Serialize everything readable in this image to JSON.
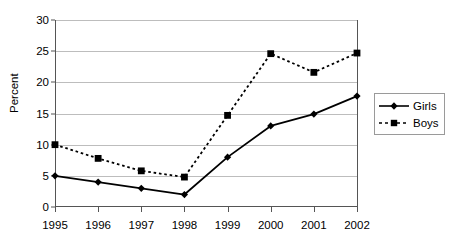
{
  "chart_data": {
    "type": "line",
    "title": "",
    "subtitle": "",
    "xlabel": "",
    "ylabel": "Percent",
    "categories": [
      "1995",
      "1996",
      "1997",
      "1998",
      "1999",
      "2000",
      "2001",
      "2002"
    ],
    "x": [
      1995,
      1996,
      1997,
      1998,
      1999,
      2000,
      2001,
      2002
    ],
    "series": [
      {
        "name": "Girls",
        "values": [
          5.0,
          4.0,
          3.0,
          2.0,
          8.0,
          13.0,
          14.9,
          17.8
        ],
        "line_style": "solid",
        "marker": "diamond",
        "color": "#000000"
      },
      {
        "name": "Boys",
        "values": [
          10.0,
          7.8,
          5.8,
          4.8,
          14.7,
          24.6,
          21.6,
          24.7
        ],
        "line_style": "dotted",
        "marker": "square",
        "color": "#000000"
      }
    ],
    "ylim": [
      0,
      30
    ],
    "yticks": [
      0,
      5,
      10,
      15,
      20,
      25,
      30
    ],
    "ytick_labels": [
      "0",
      "5",
      "10",
      "15",
      "20",
      "25",
      "30"
    ],
    "grid": true,
    "grid_axis": "y",
    "grid_color": "#bdbdbd",
    "legend": [
      "Girls",
      "Boys"
    ],
    "legend_position": "right",
    "background_color": "#ffffff",
    "axis_color": "#555555"
  },
  "legend": {
    "items": [
      {
        "label": "Girls",
        "marker": "diamond-marker",
        "style": "solid"
      },
      {
        "label": "Boys",
        "marker": "square-marker",
        "style": "dotted"
      }
    ]
  },
  "axes": {
    "y_title": "Percent"
  }
}
